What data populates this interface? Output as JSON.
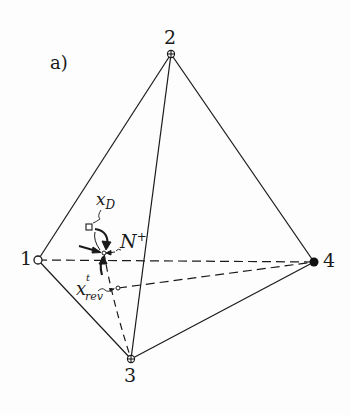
{
  "panel_label": "a)",
  "vertices": [
    {
      "id": "1",
      "label": "1",
      "marker": "open-circle"
    },
    {
      "id": "2",
      "label": "2",
      "marker": "crossed-circle"
    },
    {
      "id": "3",
      "label": "3",
      "marker": "crossed-circle"
    },
    {
      "id": "4",
      "label": "4",
      "marker": "filled-circle"
    }
  ],
  "annotations": {
    "x_d": {
      "base": "x",
      "sub": "D"
    },
    "n_plus": {
      "base": "N",
      "sup": "+"
    },
    "x_rev": {
      "base": "x",
      "sup": "t",
      "sub": "rev"
    }
  },
  "colors": {
    "line": "#1a1a1a",
    "background": "#fdfdfd"
  }
}
